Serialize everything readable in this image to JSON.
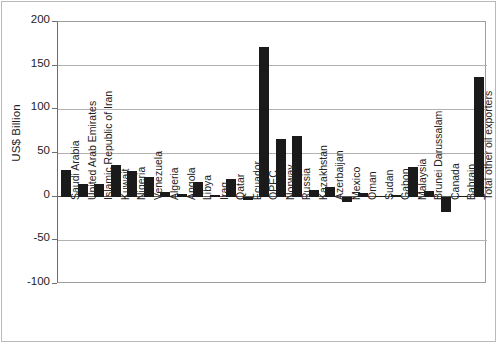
{
  "chart_data": {
    "type": "bar",
    "title": "",
    "subtitle": "",
    "xlabel": "",
    "ylabel": "US$ Billion",
    "ylim": [
      -100,
      200
    ],
    "ytick_values": [
      200,
      150,
      100,
      50,
      0,
      -50,
      -100
    ],
    "ytick_labels": [
      "200",
      "150",
      "100",
      "50",
      "0",
      "-50",
      "-100"
    ],
    "grid": true,
    "legend": "none",
    "bar_color": "#1a1a1a",
    "categories": [
      "Saudi Arabia",
      "United Arab Emirates",
      "Islamic Republic of Iran",
      "Kuwait",
      "Nigeria",
      "Venezuela",
      "Algeria",
      "Angola",
      "Libya",
      "Iraq",
      "Qatar",
      "Ecuador",
      "OPEC",
      "Norway",
      "Russia",
      "Kazakhstan",
      "Azerbaijan",
      "Mexico",
      "Oman",
      "Sudan",
      "Gabon",
      "Malaysia",
      "Brunei Darussalam",
      "Canada",
      "Bahrain",
      "Total other oil exporters"
    ],
    "values": [
      30,
      15,
      15,
      36,
      29,
      23,
      5,
      3,
      17,
      2,
      20,
      -4,
      171,
      66,
      69,
      8,
      11,
      -6,
      4,
      1,
      2,
      34,
      7,
      -17,
      1,
      137
    ]
  },
  "axis": {
    "y_unit_caption": "US$ Billion"
  }
}
